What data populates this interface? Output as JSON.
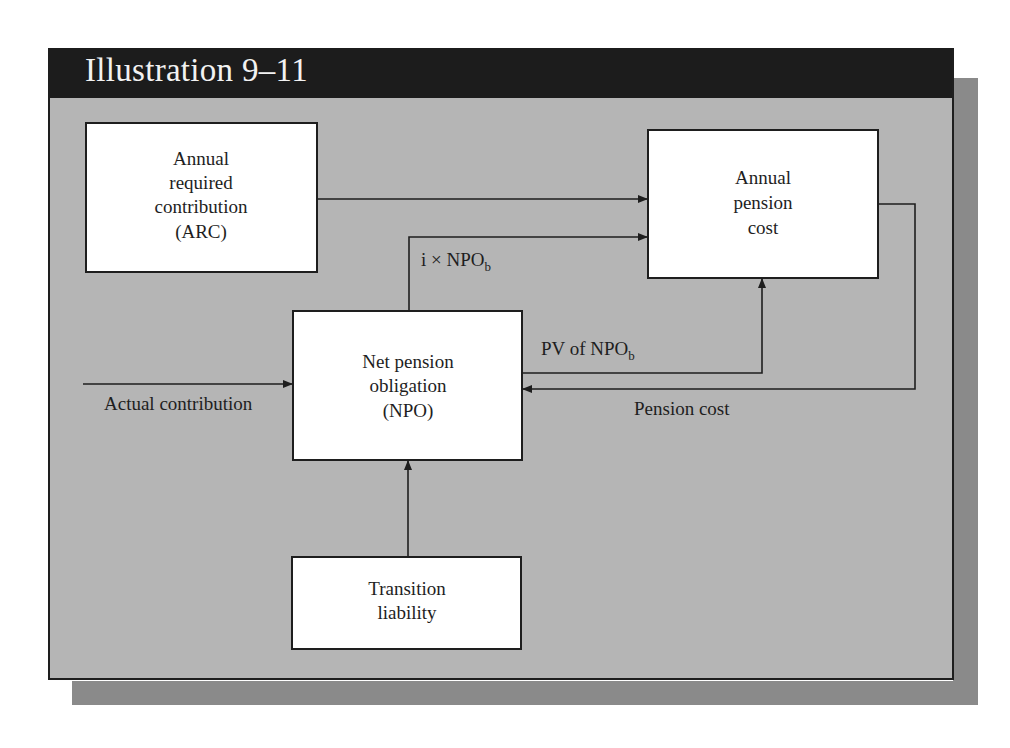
{
  "title": "Illustration 9–11",
  "colors": {
    "title_bar": "#1c1c1c",
    "panel": "#b5b5b5",
    "shadow": "#8a8a8a",
    "box": "#ffffff",
    "line": "#1e1e1e"
  },
  "boxes": {
    "arc": {
      "lines": [
        "Annual",
        "required",
        "contribution",
        "(ARC)"
      ]
    },
    "annual_pension_cost": {
      "lines": [
        "Annual",
        "pension",
        "cost"
      ]
    },
    "npo": {
      "lines": [
        "Net pension",
        "obligation",
        "(NPO)"
      ]
    },
    "transition": {
      "lines": [
        "Transition",
        "liability"
      ]
    }
  },
  "labels": {
    "interest": {
      "main": "i × NPO",
      "sub": "b"
    },
    "pv": {
      "main": "PV of NPO",
      "sub": "b"
    },
    "pension_cost": "Pension cost",
    "actual_contribution": "Actual contribution"
  }
}
